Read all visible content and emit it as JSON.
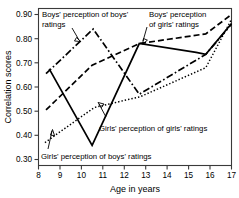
{
  "chart_data": {
    "type": "line",
    "title": "",
    "xlabel": "Age in years",
    "ylabel": "Correlation scores",
    "xlim": [
      8,
      17
    ],
    "ylim": [
      0.28,
      0.93
    ],
    "xticks": [
      8,
      9,
      10,
      11,
      12,
      13,
      14,
      15,
      16,
      17
    ],
    "xtick_labels": [
      "8",
      "9",
      "10",
      "11",
      "12",
      "13",
      "14",
      "15",
      "16",
      "17"
    ],
    "yticks": [
      0.3,
      0.4,
      0.5,
      0.6,
      0.7,
      0.8,
      0.9
    ],
    "ytick_labels": [
      "0.30",
      "0.40",
      "0.50",
      "0.60",
      "0.70",
      "0.80",
      "0.90"
    ],
    "grid": false,
    "legend_position": "inline-annotations",
    "series": [
      {
        "name": "Boys' perception of boys' ratings",
        "style": "dash-dot",
        "x": [
          8.35,
          10.55,
          12.7,
          15.8,
          17.0
        ],
        "values": [
          0.66,
          0.845,
          0.575,
          0.74,
          0.865
        ]
      },
      {
        "name": "Boys' perception of girls' ratings",
        "style": "dashed",
        "x": [
          8.35,
          10.5,
          12.7,
          15.8,
          17.0
        ],
        "values": [
          0.51,
          0.695,
          0.785,
          0.825,
          0.905
        ]
      },
      {
        "name": "Girls' perception of girls' ratings",
        "style": "solid",
        "x": [
          8.5,
          10.5,
          12.7,
          15.35,
          15.8,
          17.0
        ],
        "values": [
          0.68,
          0.363,
          0.785,
          0.748,
          0.74,
          0.868
        ]
      },
      {
        "name": "Girls' perception of boys' ratings",
        "style": "dotted",
        "x": [
          8.3,
          10.6,
          12.75,
          15.8,
          17.0
        ],
        "values": [
          0.375,
          0.52,
          0.565,
          0.685,
          0.885
        ]
      }
    ],
    "annotations": [
      {
        "id": "boys-boys",
        "text_line1": "Boys' perception of boys'",
        "text_line2": "ratings"
      },
      {
        "id": "boys-girls",
        "text_line1": "Boys' perception",
        "text_line2": "of girls' ratings"
      },
      {
        "id": "girls-girls",
        "text_line1": "Girls' perception of girls' ratings",
        "text_line2": ""
      },
      {
        "id": "girls-boys",
        "text_line1": "Girls' perception of boys' ratings",
        "text_line2": ""
      }
    ]
  },
  "axes": {
    "x_title": "Age in years",
    "y_title": "Correlation scores",
    "x_tick_labels": [
      "8",
      "9",
      "10",
      "11",
      "12",
      "13",
      "14",
      "15",
      "16",
      "17"
    ],
    "y_tick_labels": [
      "0.30",
      "0.40",
      "0.50",
      "0.60",
      "0.70",
      "0.80",
      "0.90"
    ]
  },
  "labels": {
    "boys_boys_l1": "Boys' perception of boys'",
    "boys_boys_l2": "ratings",
    "boys_girls_l1": "Boys' perception",
    "boys_girls_l2": "of girls' ratings",
    "girls_girls": "Girls' perception of girls' ratings",
    "girls_boys": "Girls' perception of boys' ratings"
  },
  "colors": {
    "line": "#000000",
    "frame": "#3a3a3a",
    "background": "#ffffff"
  }
}
